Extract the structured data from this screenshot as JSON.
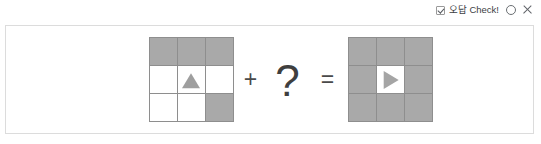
{
  "header": {
    "checkbox_icon": "checkbox-checked-icon",
    "wrong_answer_label": "오답 Check!",
    "circle_icon": "circle-icon",
    "close_icon": "x-icon",
    "text_color": "#3c4043",
    "icon_color": "#5f6368"
  },
  "panel": {
    "border_color": "#dcdcdc",
    "background": "#ffffff"
  },
  "equation": {
    "plus_symbol": "+",
    "unknown_symbol": "?",
    "equals_symbol": "=",
    "operator_color": "#4a4a4a"
  },
  "colors": {
    "cell_filled": "#a9a9a9",
    "cell_empty": "#ffffff",
    "grid_line": "#8e8e8e",
    "shape_gray": "#9e9e9e"
  },
  "left_grid": {
    "name": "first-operand-grid",
    "rows": 3,
    "cols": 3,
    "cells": [
      {
        "filled": true,
        "shape": "none"
      },
      {
        "filled": true,
        "shape": "none"
      },
      {
        "filled": true,
        "shape": "none"
      },
      {
        "filled": false,
        "shape": "none"
      },
      {
        "filled": false,
        "shape": "triangle-up"
      },
      {
        "filled": false,
        "shape": "none"
      },
      {
        "filled": false,
        "shape": "none"
      },
      {
        "filled": false,
        "shape": "none"
      },
      {
        "filled": true,
        "shape": "none"
      }
    ]
  },
  "right_grid": {
    "name": "result-grid",
    "rows": 3,
    "cols": 3,
    "cells": [
      {
        "filled": true,
        "shape": "none"
      },
      {
        "filled": true,
        "shape": "none"
      },
      {
        "filled": true,
        "shape": "none"
      },
      {
        "filled": true,
        "shape": "none"
      },
      {
        "filled": false,
        "shape": "triangle-right"
      },
      {
        "filled": true,
        "shape": "none"
      },
      {
        "filled": true,
        "shape": "none"
      },
      {
        "filled": true,
        "shape": "none"
      },
      {
        "filled": true,
        "shape": "none"
      }
    ]
  }
}
